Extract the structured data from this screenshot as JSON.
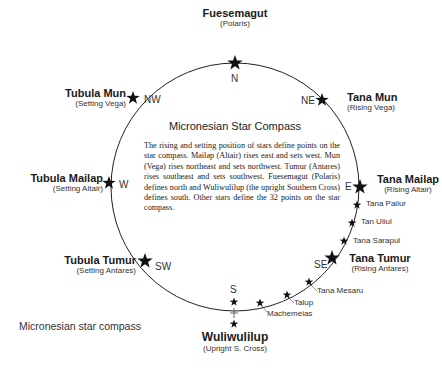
{
  "diagram": {
    "title": "Micronesian Star Compass",
    "description": "The rising and setting position of stars define points on the star compass. Mailap (Altair) rises east and sets west. Mun (Vega) rises northeast and sets northwest. Tumur (Antares) rises southeast and sets southwest. Fuesemagut (Polaris) defines north and Wuliwulilup (the upright Southern Cross) defines south. Other stars define the 32 points on the star compass.",
    "caption": "Micronesian star compass",
    "directions": {
      "n": "N",
      "ne": "NE",
      "e": "E",
      "se": "SE",
      "s": "S",
      "sw": "SW",
      "w": "W",
      "nw": "NW"
    },
    "major_stars": {
      "north": {
        "name": "Fuesemagut",
        "sub": "(Polaris)"
      },
      "northeast": {
        "name": "Tana Mun",
        "sub": "(Rising Vega)"
      },
      "east": {
        "name": "Tana Mailap",
        "sub": "(Rising Altair)"
      },
      "southeast": {
        "name": "Tana Tumur",
        "sub": "(Rising Antares)"
      },
      "south": {
        "name": "Wuliwulilup",
        "sub": "(Upright S. Cross)"
      },
      "southwest": {
        "name": "Tubula Tumur",
        "sub": "(Setting Antares)"
      },
      "west": {
        "name": "Tubula Mailap",
        "sub": "(Setting Altair)"
      },
      "northwest": {
        "name": "Tubula Mun",
        "sub": "(Setting Vega)"
      }
    },
    "minor_stars": [
      {
        "name": "Tana Paiiur"
      },
      {
        "name": "Tan Uliul"
      },
      {
        "name": "Tana Sarapul"
      },
      {
        "name": "Tana Mesaru"
      },
      {
        "name": "Talup"
      },
      {
        "name": "Machemeias"
      }
    ],
    "colors": {
      "line": "#222222",
      "star": "#111111",
      "background": "#ffffff"
    }
  }
}
